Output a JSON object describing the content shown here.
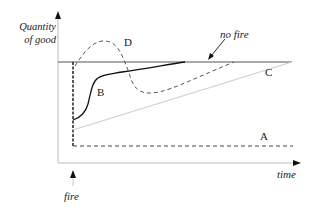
{
  "diagram": {
    "y_axis_label_line1": "Quantity",
    "y_axis_label_line2": "of good",
    "x_axis_label": "time",
    "event_label": "fire",
    "annotation": "no fire",
    "curves": [
      {
        "id": "A",
        "label": "A",
        "style": "dashed",
        "description": "drops to low level after fire and stays flat"
      },
      {
        "id": "B",
        "label": "B",
        "style": "solid",
        "description": "drops then recovers quickly (S-shape) back toward baseline"
      },
      {
        "id": "C",
        "label": "C",
        "style": "light-gray solid",
        "description": "drops then recovers slowly linearly to baseline"
      },
      {
        "id": "D",
        "label": "D",
        "style": "dashed",
        "description": "drops then overshoots above baseline, dips below, then recovers"
      }
    ],
    "baseline": "no fire"
  }
}
